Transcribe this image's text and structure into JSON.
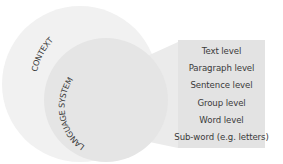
{
  "diagram": {
    "outer_circle": {
      "label": "CONTEXT",
      "color": "#f1f1f1"
    },
    "inner_circle": {
      "label": "LANGUAGE SYSTEM",
      "color": "#e6e6e6"
    },
    "connector": {
      "color": "#ececec"
    },
    "levels_box": {
      "color": "#e3e3e3",
      "items": [
        "Text level",
        "Paragraph level",
        "Sentence level",
        "Group level",
        "Word level",
        "Sub-word (e.g. letters)"
      ]
    }
  }
}
